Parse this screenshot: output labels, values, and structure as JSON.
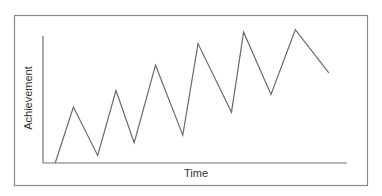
{
  "chart_data": {
    "type": "line",
    "title": "",
    "xlabel": "Time",
    "ylabel": "Achievement",
    "grid": false,
    "legend": null,
    "ticks": false,
    "xlim": [
      0,
      100
    ],
    "ylim": [
      0,
      100
    ],
    "x": [
      4,
      10,
      18,
      24,
      30,
      37,
      46,
      51,
      62,
      66,
      75,
      83,
      94
    ],
    "y": [
      0,
      44,
      6,
      57,
      16,
      77,
      22,
      94,
      40,
      103,
      54,
      105,
      71
    ],
    "series": [
      {
        "name": "Achievement",
        "points": [
          {
            "x": 4,
            "y": 0
          },
          {
            "x": 10,
            "y": 44
          },
          {
            "x": 18,
            "y": 6
          },
          {
            "x": 24,
            "y": 57
          },
          {
            "x": 30,
            "y": 16
          },
          {
            "x": 37,
            "y": 77
          },
          {
            "x": 46,
            "y": 22
          },
          {
            "x": 51,
            "y": 94
          },
          {
            "x": 62,
            "y": 40
          },
          {
            "x": 66,
            "y": 103
          },
          {
            "x": 75,
            "y": 54
          },
          {
            "x": 83,
            "y": 105
          },
          {
            "x": 94,
            "y": 71
          }
        ]
      }
    ]
  },
  "layout": {
    "frame": {
      "x": 14,
      "y": 15,
      "w": 353,
      "h": 170
    },
    "plot": {
      "x0": 43,
      "y0": 163,
      "x1": 347,
      "ytop": 36
    },
    "colors": {
      "line": "#6a6a6a",
      "axis": "#707070",
      "frame": "#8a8a8a",
      "text": "#333333"
    }
  }
}
